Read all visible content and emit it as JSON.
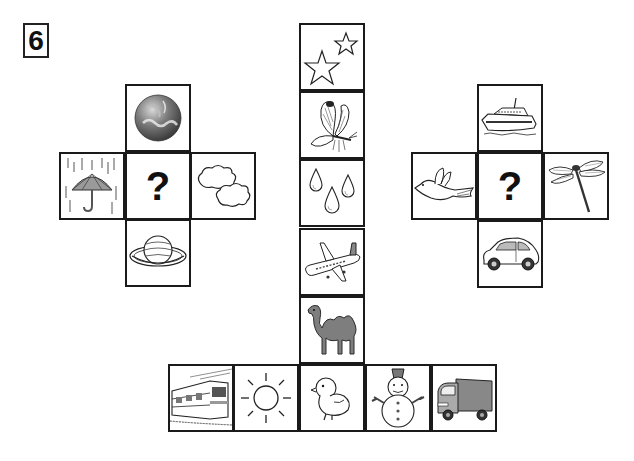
{
  "puzzle_number": "6",
  "left_cross": {
    "top": {
      "icon": "earth-globe-icon"
    },
    "left": {
      "icon": "umbrella-rain-icon"
    },
    "center": {
      "label": "?"
    },
    "right": {
      "icon": "clouds-icon"
    },
    "bottom": {
      "icon": "saturn-planet-icon"
    }
  },
  "right_cross": {
    "top": {
      "icon": "ferry-ship-icon"
    },
    "left": {
      "icon": "bird-icon"
    },
    "center": {
      "label": "?"
    },
    "right": {
      "icon": "dragonfly-icon"
    },
    "bottom": {
      "icon": "car-icon"
    }
  },
  "column": [
    {
      "icon": "stars-icon"
    },
    {
      "icon": "butterfly-icon"
    },
    {
      "icon": "water-drops-icon"
    },
    {
      "icon": "airplane-icon"
    },
    {
      "icon": "camel-icon"
    }
  ],
  "bottom_row": [
    {
      "icon": "train-icon"
    },
    {
      "icon": "sun-icon"
    },
    {
      "icon": "chick-icon"
    },
    {
      "icon": "snowman-icon"
    },
    {
      "icon": "truck-icon"
    }
  ]
}
